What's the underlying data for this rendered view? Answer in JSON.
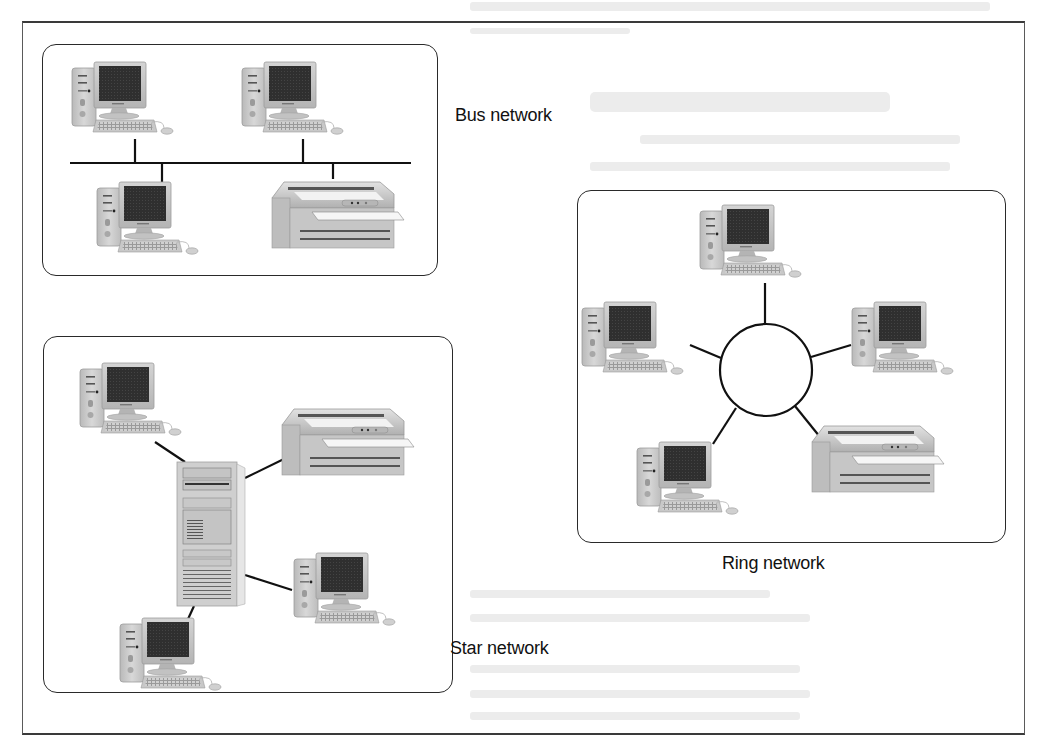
{
  "figure": {
    "type": "network-topologies",
    "colors": {
      "frame": "#5a5a5a",
      "link": "#111111",
      "device_body": "#c9c9c9",
      "screen": "#2e2e2e",
      "background": "#ffffff"
    }
  },
  "networks": {
    "bus": {
      "label": "Bus network",
      "topology": "bus",
      "devices": [
        {
          "kind": "computer",
          "position": "top-left"
        },
        {
          "kind": "computer",
          "position": "top-right"
        },
        {
          "kind": "computer",
          "position": "bottom-left"
        },
        {
          "kind": "printer",
          "position": "bottom-right"
        }
      ]
    },
    "ring": {
      "label": "Ring network",
      "topology": "ring",
      "devices": [
        {
          "kind": "computer",
          "position": "top"
        },
        {
          "kind": "computer",
          "position": "left"
        },
        {
          "kind": "computer",
          "position": "right"
        },
        {
          "kind": "computer",
          "position": "bottom-left"
        },
        {
          "kind": "printer",
          "position": "bottom-right"
        }
      ]
    },
    "star": {
      "label": "Star network",
      "topology": "star",
      "hub": {
        "kind": "server-tower"
      },
      "devices": [
        {
          "kind": "computer",
          "position": "top-left"
        },
        {
          "kind": "printer",
          "position": "top-right"
        },
        {
          "kind": "computer",
          "position": "right"
        },
        {
          "kind": "computer",
          "position": "bottom-left"
        }
      ]
    }
  }
}
